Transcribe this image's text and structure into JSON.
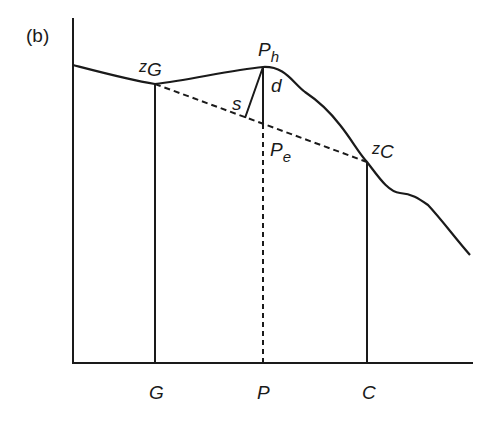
{
  "figure": {
    "panel_label": "(b)",
    "points": {
      "zG": {
        "base": "z",
        "sub": "G"
      },
      "zC": {
        "base": "z",
        "sub": "C"
      },
      "Ph": {
        "base": "P",
        "sub": "h"
      },
      "Pe": {
        "base": "P",
        "sub": "e"
      }
    },
    "segment_labels": {
      "s": "s",
      "d": "d"
    },
    "axis_labels": {
      "G": "G",
      "P": "P",
      "C": "C"
    },
    "colors": {
      "line": "#1a1a1a",
      "background": "#ffffff"
    }
  }
}
